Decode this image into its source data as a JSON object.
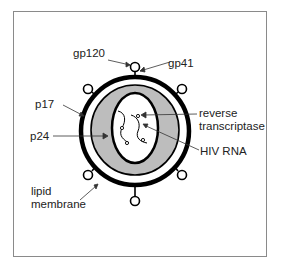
{
  "diagram": {
    "labels": {
      "gp120": "gp120",
      "gp41": "gp41",
      "p17": "p17",
      "p24": "p24",
      "lipid_line1": "lipid",
      "lipid_line2": "membrane",
      "rt_line1": "reverse",
      "rt_line2": "transcriptase",
      "hiv_rna": "HIV RNA"
    },
    "colors": {
      "membrane": "#000000",
      "capsid_fill": "#bdbdbd",
      "frame": "#8a8a8a",
      "text": "#222222"
    }
  }
}
